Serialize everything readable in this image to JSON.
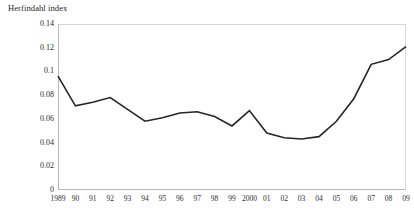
{
  "chart_data": {
    "type": "line",
    "title": "Herfindahl index",
    "xlabel": "",
    "ylabel": "",
    "ylim": [
      0,
      0.14
    ],
    "ytick_labels": [
      "0",
      "0.02",
      "0.04",
      "0.06",
      "0.08",
      "0.1",
      "0.12",
      "0.14"
    ],
    "ytick_values": [
      0,
      0.02,
      0.04,
      0.06,
      0.08,
      0.1,
      0.12,
      0.14
    ],
    "grid": false,
    "legend": "none",
    "categories": [
      "1989",
      "90",
      "91",
      "92",
      "93",
      "94",
      "95",
      "96",
      "97",
      "98",
      "99",
      "2000",
      "01",
      "02",
      "03",
      "04",
      "05",
      "06",
      "07",
      "08",
      "09"
    ],
    "x": [
      1989,
      1990,
      1991,
      1992,
      1993,
      1994,
      1995,
      1996,
      1997,
      1998,
      1999,
      2000,
      2001,
      2002,
      2003,
      2004,
      2005,
      2006,
      2007,
      2008,
      2009
    ],
    "values": [
      0.096,
      0.071,
      0.074,
      0.078,
      0.068,
      0.058,
      0.061,
      0.065,
      0.066,
      0.062,
      0.054,
      0.067,
      0.048,
      0.044,
      0.043,
      0.045,
      0.058,
      0.077,
      0.106,
      0.11,
      0.121
    ],
    "series": [
      {
        "name": "Herfindahl index",
        "color": "#262626",
        "values": [
          0.096,
          0.071,
          0.074,
          0.078,
          0.068,
          0.058,
          0.061,
          0.065,
          0.066,
          0.062,
          0.054,
          0.067,
          0.048,
          0.044,
          0.043,
          0.045,
          0.058,
          0.077,
          0.106,
          0.11,
          0.121
        ]
      }
    ]
  }
}
